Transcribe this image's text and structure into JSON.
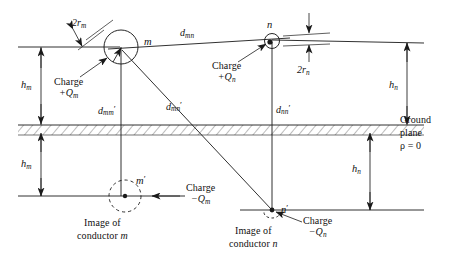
{
  "figure": {
    "ground_plane_label_line1": "Ground",
    "ground_plane_label_line2": "plane",
    "ground_plane_label_line3": "ρ = 0",
    "ground_plane_rho_symbol": "ρ",
    "ground_plane_rho_value": "0"
  },
  "conductors": [
    {
      "id": "m",
      "node_label": "m",
      "radius_label_main": "2r",
      "radius_label_sub": "m",
      "charge_label_line1": "Charge",
      "charge_label_line2": "+Q",
      "charge_label_sub": "m",
      "height_label_main": "h",
      "height_label_sub": "m"
    },
    {
      "id": "n",
      "node_label": "n",
      "radius_label_main": "2r",
      "radius_label_sub": "n",
      "charge_label_line1": "Charge",
      "charge_label_line2": "+Q",
      "charge_label_sub": "n",
      "height_label_main": "h",
      "height_label_sub": "n"
    }
  ],
  "images": [
    {
      "id": "m-prime",
      "node_label": "m",
      "node_prime": "′",
      "charge_label_line1": "Charge",
      "charge_label_line2": "−Q",
      "charge_label_sub": "m",
      "caption_line1": "Image of",
      "caption_line2": "conductor m",
      "caption_line2_text": "conductor ",
      "caption_line2_ital": "m",
      "height_label_main": "h",
      "height_label_sub": "m"
    },
    {
      "id": "n-prime",
      "node_label": "n",
      "node_prime": "′",
      "charge_label_line1": "Charge",
      "charge_label_line2": "−Q",
      "charge_label_sub": "n",
      "caption_line1": "Image of",
      "caption_line2_text": "conductor ",
      "caption_line2_ital": "n",
      "height_label_main": "h",
      "height_label_sub": "n"
    }
  ],
  "distances": [
    {
      "id": "d-mn",
      "main": "d",
      "sub": "mn",
      "prime": ""
    },
    {
      "id": "d-mm-prime",
      "main": "d",
      "sub": "mm",
      "prime": "′"
    },
    {
      "id": "d-mn-prime",
      "main": "d",
      "sub": "mn",
      "prime": "′"
    },
    {
      "id": "d-nn-prime",
      "main": "d",
      "sub": "nn",
      "prime": "′"
    }
  ],
  "colors": {
    "line": "#1a1a1a",
    "hatch": "#555555",
    "background": "#ffffff",
    "text": "#111111"
  }
}
